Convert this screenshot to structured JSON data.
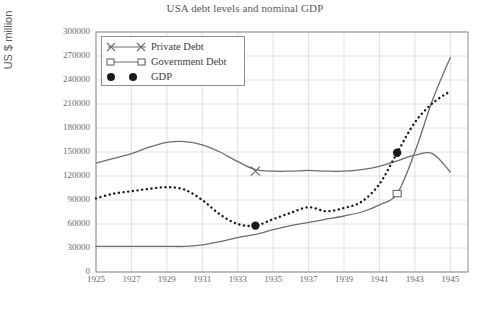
{
  "chart_data": {
    "type": "line",
    "title": "USA debt levels and nominal GDP",
    "xlabel": "US Census",
    "ylabel": "US $ million",
    "xlim": [
      1925,
      1946
    ],
    "ylim": [
      0,
      300000
    ],
    "grid": true,
    "legend_position": "top-left-inside",
    "x_ticks": [
      "1925",
      "1927",
      "1929",
      "1931",
      "1933",
      "1935",
      "1937",
      "1939",
      "1941",
      "1943",
      "1945"
    ],
    "y_ticks": [
      "0",
      "30000",
      "60000",
      "90000",
      "120000",
      "150000",
      "180000",
      "210000",
      "240000",
      "270000",
      "300000"
    ],
    "x": [
      1925,
      1926,
      1927,
      1928,
      1929,
      1930,
      1931,
      1932,
      1933,
      1934,
      1935,
      1936,
      1937,
      1938,
      1939,
      1940,
      1941,
      1942,
      1943,
      1944,
      1945
    ],
    "series": [
      {
        "name": "Private Debt",
        "style": "solid",
        "color": "#6e6e6e",
        "marker": "x",
        "marker_points": [
          {
            "x": 1934,
            "y": 126000
          }
        ],
        "values": [
          136000,
          142000,
          148000,
          156000,
          162000,
          163000,
          159000,
          150000,
          138000,
          128000,
          126000,
          126000,
          127000,
          126000,
          126000,
          128000,
          132000,
          139000,
          146000,
          148000,
          125000
        ]
      },
      {
        "name": "Government Debt",
        "style": "solid",
        "color": "#6e6e6e",
        "marker": "square",
        "marker_points": [
          {
            "x": 1942,
            "y": 98000
          }
        ],
        "values": [
          32000,
          32000,
          32000,
          32000,
          32000,
          32000,
          34000,
          38000,
          43000,
          47000,
          53000,
          58000,
          62000,
          66000,
          70000,
          75000,
          84000,
          98000,
          150000,
          215000,
          268000
        ]
      },
      {
        "name": "GDP",
        "style": "dotted",
        "color": "#1a1a1a",
        "marker": "circle",
        "marker_points": [
          {
            "x": 1934,
            "y": 58000
          },
          {
            "x": 1942,
            "y": 149000
          }
        ],
        "values": [
          92000,
          98000,
          101000,
          104000,
          106000,
          103000,
          90000,
          72000,
          60000,
          58000,
          66000,
          74000,
          81000,
          76000,
          80000,
          88000,
          110000,
          149000,
          187000,
          211000,
          226000
        ]
      }
    ]
  },
  "legend": {
    "items": [
      {
        "label": "Private Debt",
        "icon": "x-marker-icon"
      },
      {
        "label": "Government Debt",
        "icon": "square-marker-icon"
      },
      {
        "label": "GDP",
        "icon": "circle-marker-icon"
      }
    ]
  }
}
